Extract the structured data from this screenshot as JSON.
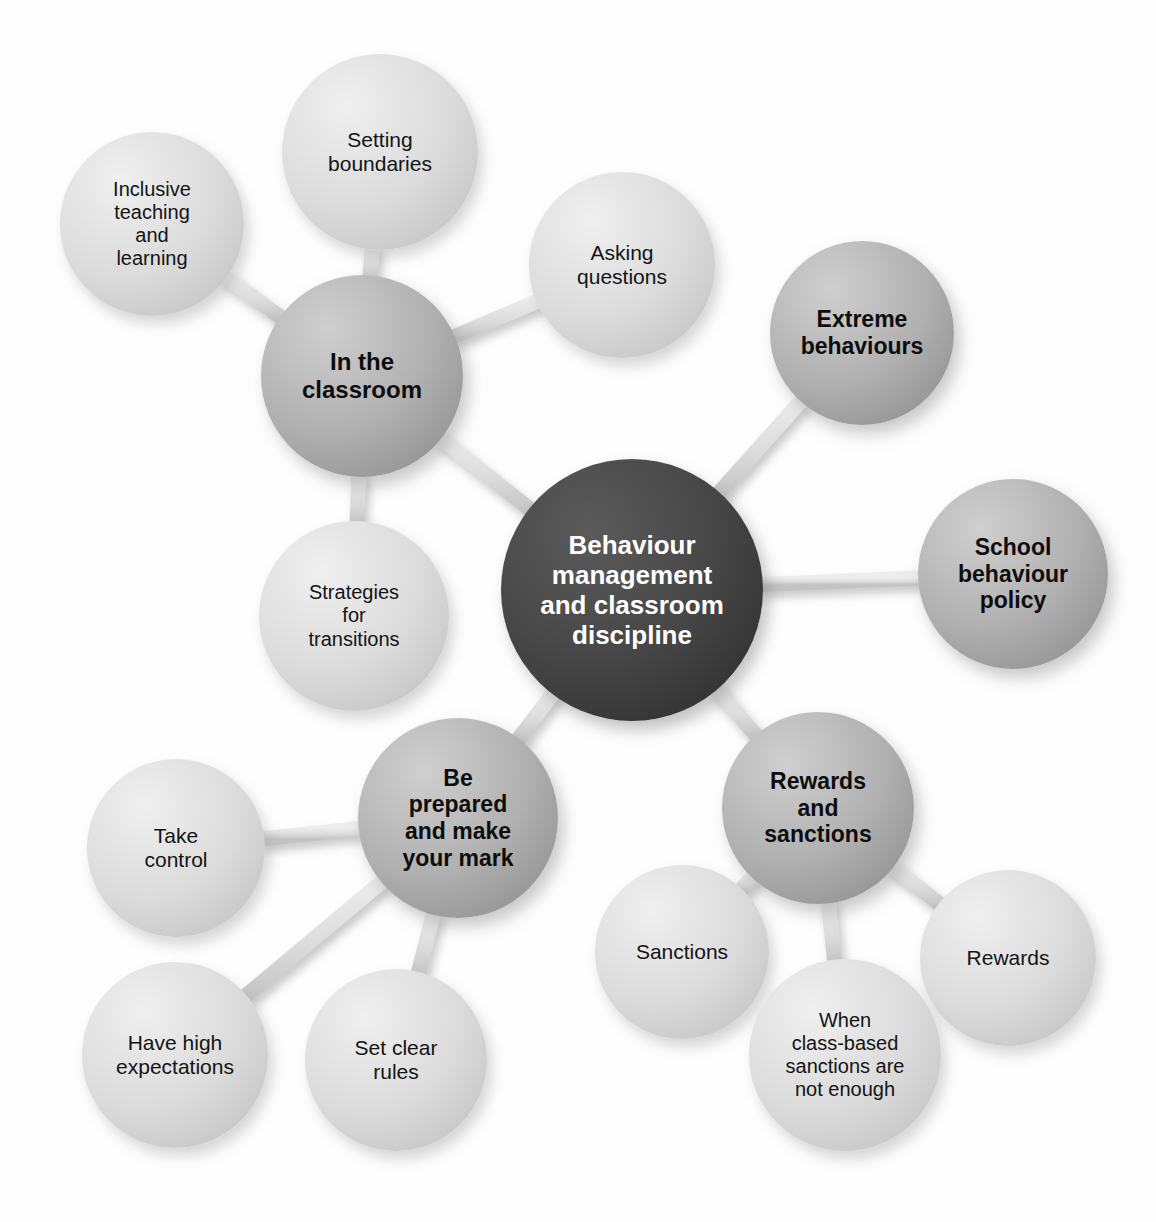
{
  "diagram": {
    "title": "Behaviour management and classroom discipline",
    "type": "mind-map",
    "background_color": "#ffffff",
    "colors": {
      "hub_fill": "#3d3d3d",
      "hub_text": "#ffffff",
      "primary_fill": "#aeaeae",
      "primary_text": "#0d0d0d",
      "leaf_fill": "#dcdcdc",
      "leaf_text": "#141414",
      "connector": "#d6d6d6"
    }
  },
  "hub": {
    "label": "Behaviour\nmanagement\nand classroom\ndiscipline",
    "cx": 632,
    "cy": 590,
    "r": 131,
    "font_size": 26
  },
  "nodes": [
    {
      "id": "in-the-classroom",
      "label": "In the\nclassroom",
      "level": "primary",
      "cx": 362,
      "cy": 376,
      "r": 101,
      "font_size": 24
    },
    {
      "id": "setting-boundaries",
      "label": "Setting\nboundaries",
      "level": "leaf",
      "cx": 380,
      "cy": 152,
      "r": 98,
      "font_size": 21
    },
    {
      "id": "inclusive-teaching-and-learning",
      "label": "Inclusive\nteaching\nand\nlearning",
      "level": "leaf",
      "cx": 152,
      "cy": 224,
      "r": 92,
      "font_size": 20
    },
    {
      "id": "asking-questions",
      "label": "Asking\nquestions",
      "level": "leaf",
      "cx": 622,
      "cy": 265,
      "r": 93,
      "font_size": 21
    },
    {
      "id": "strategies-for-transitions",
      "label": "Strategies\nfor\ntransitions",
      "level": "leaf",
      "cx": 354,
      "cy": 616,
      "r": 95,
      "font_size": 20
    },
    {
      "id": "extreme-behaviours",
      "label": "Extreme\nbehaviours",
      "level": "primary",
      "cx": 862,
      "cy": 333,
      "r": 92,
      "font_size": 23
    },
    {
      "id": "school-behaviour-policy",
      "label": "School\nbehaviour\npolicy",
      "level": "primary",
      "cx": 1013,
      "cy": 574,
      "r": 95,
      "font_size": 23
    },
    {
      "id": "rewards-and-sanctions",
      "label": "Rewards\nand\nsanctions",
      "level": "primary",
      "cx": 818,
      "cy": 808,
      "r": 96,
      "font_size": 23
    },
    {
      "id": "sanctions",
      "label": "Sanctions",
      "level": "leaf",
      "cx": 682,
      "cy": 952,
      "r": 87,
      "font_size": 21
    },
    {
      "id": "rewards",
      "label": "Rewards",
      "level": "leaf",
      "cx": 1008,
      "cy": 958,
      "r": 88,
      "font_size": 21
    },
    {
      "id": "when-class-based-sanctions-are-not-enough",
      "label": "When\nclass-based\nsanctions are\nnot enough",
      "level": "leaf",
      "cx": 845,
      "cy": 1055,
      "r": 96,
      "font_size": 20
    },
    {
      "id": "be-prepared-and-make-your-mark",
      "label": "Be\nprepared\nand make\nyour mark",
      "level": "primary",
      "cx": 458,
      "cy": 818,
      "r": 100,
      "font_size": 23
    },
    {
      "id": "take-control",
      "label": "Take\ncontrol",
      "level": "leaf",
      "cx": 176,
      "cy": 848,
      "r": 89,
      "font_size": 21
    },
    {
      "id": "have-high-expectations",
      "label": "Have high\nexpectations",
      "level": "leaf",
      "cx": 175,
      "cy": 1055,
      "r": 93,
      "font_size": 21
    },
    {
      "id": "set-clear-rules",
      "label": "Set clear\nrules",
      "level": "leaf",
      "cx": 396,
      "cy": 1060,
      "r": 91,
      "font_size": 21
    }
  ],
  "connections": [
    {
      "from": "hub",
      "to": "in-the-classroom"
    },
    {
      "from": "hub",
      "to": "extreme-behaviours"
    },
    {
      "from": "hub",
      "to": "school-behaviour-policy"
    },
    {
      "from": "hub",
      "to": "rewards-and-sanctions"
    },
    {
      "from": "hub",
      "to": "be-prepared-and-make-your-mark"
    },
    {
      "from": "in-the-classroom",
      "to": "setting-boundaries"
    },
    {
      "from": "in-the-classroom",
      "to": "inclusive-teaching-and-learning"
    },
    {
      "from": "in-the-classroom",
      "to": "asking-questions"
    },
    {
      "from": "in-the-classroom",
      "to": "strategies-for-transitions"
    },
    {
      "from": "rewards-and-sanctions",
      "to": "sanctions"
    },
    {
      "from": "rewards-and-sanctions",
      "to": "rewards"
    },
    {
      "from": "rewards-and-sanctions",
      "to": "when-class-based-sanctions-are-not-enough"
    },
    {
      "from": "be-prepared-and-make-your-mark",
      "to": "take-control"
    },
    {
      "from": "be-prepared-and-make-your-mark",
      "to": "have-high-expectations"
    },
    {
      "from": "be-prepared-and-make-your-mark",
      "to": "set-clear-rules"
    }
  ]
}
